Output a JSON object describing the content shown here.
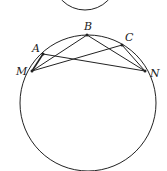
{
  "diagram": {
    "type": "circle-geometry",
    "colors": {
      "stroke": "#222222",
      "background": "#ffffff"
    },
    "top_partial_circle": {
      "cx": 85,
      "cy": -22,
      "r": 32
    },
    "main_circle": {
      "cx": 88,
      "cy": 103,
      "r": 68
    },
    "points": {
      "A": {
        "label": "A",
        "x": 43,
        "y": 54,
        "lx": 32,
        "ly": 52
      },
      "B": {
        "label": "B",
        "x": 87,
        "y": 35,
        "lx": 84,
        "ly": 30
      },
      "C": {
        "label": "C",
        "x": 122,
        "y": 45,
        "lx": 125,
        "ly": 41
      },
      "M": {
        "label": "M",
        "x": 32,
        "y": 71,
        "lx": 16,
        "ly": 75
      },
      "N": {
        "label": "N",
        "x": 145,
        "y": 71,
        "lx": 150,
        "ly": 77
      }
    },
    "segments": [
      [
        "M",
        "B"
      ],
      [
        "M",
        "C"
      ],
      [
        "A",
        "N"
      ],
      [
        "B",
        "N"
      ],
      [
        "M",
        "A"
      ],
      [
        "C",
        "N"
      ]
    ]
  }
}
